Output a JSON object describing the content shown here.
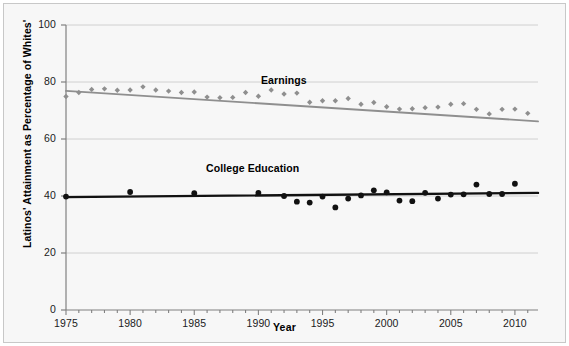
{
  "chart_data": {
    "type": "scatter",
    "title": "",
    "xlabel": "Year",
    "ylabel": "Latinos' Attainment as Percentage of Whites'",
    "xlim": [
      1975,
      2011.8
    ],
    "ylim": [
      0,
      100
    ],
    "grid": true,
    "legend_position": "inline-annotation",
    "xticks": [
      1975,
      1980,
      1985,
      1990,
      1995,
      2000,
      2005,
      2010
    ],
    "xtick_labels": [
      "1975",
      "1980",
      "1985",
      "1990",
      "1995",
      "2000",
      "2005",
      "2010"
    ],
    "minor_xtick_interval": 1,
    "yticks": [
      0,
      20,
      40,
      60,
      80,
      100
    ],
    "ytick_labels": [
      "0",
      "20",
      "40",
      "60",
      "80",
      "100"
    ],
    "series": [
      {
        "name": "Earnings",
        "color": "#8f8f8f",
        "marker": "small-diamond",
        "trendline": {
          "x0": 1975,
          "y0": 76.9,
          "x1": 2011.8,
          "y1": 66.2,
          "color": "#8f8f8f"
        },
        "x": [
          1975,
          1976,
          1977,
          1978,
          1979,
          1980,
          1981,
          1982,
          1983,
          1984,
          1985,
          1986,
          1987,
          1988,
          1989,
          1990,
          1991,
          1992,
          1993,
          1994,
          1995,
          1996,
          1997,
          1998,
          1999,
          2000,
          2001,
          2002,
          2003,
          2004,
          2005,
          2006,
          2007,
          2008,
          2009,
          2010,
          2011
        ],
        "y": [
          74.9,
          76.3,
          77.4,
          77.6,
          77.1,
          77.2,
          78.3,
          77.2,
          76.8,
          76.3,
          76.5,
          74.7,
          74.5,
          74.6,
          76.3,
          75.0,
          77.2,
          75.8,
          76.1,
          72.9,
          73.4,
          73.4,
          74.2,
          72.2,
          72.8,
          71.3,
          70.5,
          70.6,
          71.0,
          71.2,
          72.2,
          72.4,
          70.4,
          68.8,
          70.4,
          70.5,
          69.0
        ]
      },
      {
        "name": "College Education",
        "color": "#111111",
        "marker": "filled-circle",
        "trendline": {
          "x0": 1975,
          "y0": 39.6,
          "x1": 2011.8,
          "y1": 41.1,
          "color": "#111111"
        },
        "x": [
          1975,
          1980,
          1985,
          1990,
          1992,
          1993,
          1994,
          1995,
          1996,
          1997,
          1998,
          1999,
          2000,
          2001,
          2002,
          2003,
          2004,
          2005,
          2006,
          2007,
          2008,
          2009,
          2010
        ],
        "y": [
          39.8,
          41.4,
          41.0,
          41.1,
          40.0,
          38.0,
          37.7,
          39.8,
          36.0,
          39.1,
          40.2,
          42.0,
          41.3,
          38.4,
          38.2,
          41.1,
          39.1,
          40.5,
          40.6,
          44.0,
          40.7,
          40.7,
          44.3
        ]
      }
    ]
  },
  "annotations": {
    "earnings_label": "Earnings",
    "college_label": "College Education"
  }
}
